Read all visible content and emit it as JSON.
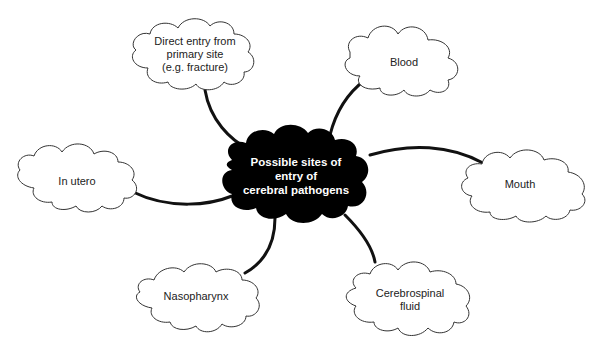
{
  "diagram": {
    "type": "mind-map",
    "colors": {
      "center_fill": "#000000",
      "center_text": "#ffffff",
      "node_fill": "#ffffff",
      "node_stroke": "#333333",
      "connector": "#111111"
    },
    "center": {
      "lines": [
        "Possible sites of",
        "entry of",
        "cerebral pathogens"
      ]
    },
    "nodes": [
      {
        "id": "direct-entry",
        "lines": [
          "Direct entry from",
          "primary site",
          "(e.g. fracture)"
        ]
      },
      {
        "id": "blood",
        "lines": [
          "Blood"
        ]
      },
      {
        "id": "in-utero",
        "lines": [
          "In utero"
        ]
      },
      {
        "id": "mouth",
        "lines": [
          "Mouth"
        ]
      },
      {
        "id": "nasopharynx",
        "lines": [
          "Nasopharynx"
        ]
      },
      {
        "id": "cerebrospinal-fluid",
        "lines": [
          "Cerebrospinal",
          "fluid"
        ]
      }
    ]
  }
}
